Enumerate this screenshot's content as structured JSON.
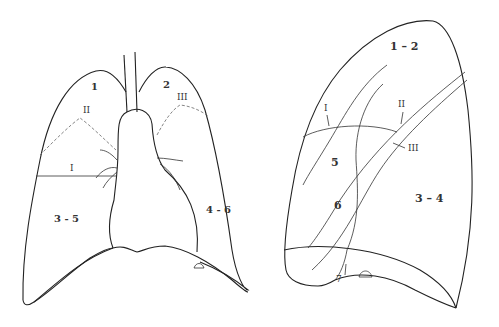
{
  "top_strip_text": "· · · · · · · · · · · · · · ·",
  "frontal_view": {
    "labels": {
      "upper_left": "1",
      "upper_right": "2",
      "fissure_left": "II",
      "fissure_right": "III",
      "horizontal_fissure": "I",
      "lower_left": "3 - 5",
      "lower_right": "4 - 6"
    }
  },
  "lateral_view": {
    "labels": {
      "upper": "1 – 2",
      "fissure_I": "I",
      "fissure_II": "II",
      "fissure_III": "III",
      "segment_5": "5",
      "segment_6": "6",
      "lower": "3 – 4",
      "segment_7": "7"
    }
  },
  "colors": {
    "line": "#222222",
    "dashed": "#666666",
    "background": "#ffffff"
  }
}
